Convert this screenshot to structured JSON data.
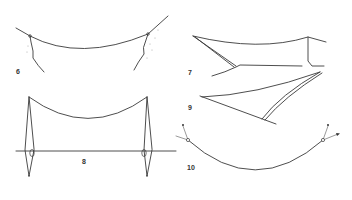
{
  "figures": [
    {
      "id": "fig-6",
      "label": "6",
      "description": "rope slung between two rock faces"
    },
    {
      "id": "fig-7",
      "label": "7",
      "description": "rope with diagonal brace and ridge line"
    },
    {
      "id": "fig-8",
      "label": "8",
      "description": "rope suspended between two upright poles with guy lines"
    },
    {
      "id": "fig-9",
      "label": "9",
      "description": "diagonal rope with double brace line"
    },
    {
      "id": "fig-10",
      "label": "10",
      "description": "curved rope with end anchors and tensioned pull lines"
    }
  ],
  "colors": {
    "line": "#3a3a3a",
    "background": "#ffffff"
  }
}
